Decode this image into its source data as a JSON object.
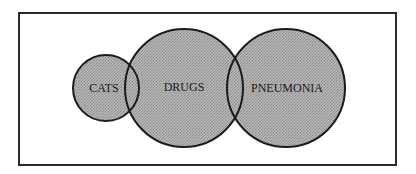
{
  "diagram": {
    "type": "venn",
    "frame": {
      "x": 19,
      "y": 13,
      "width": 377,
      "height": 152,
      "stroke": "#2a2a2a"
    },
    "fill_color": "#a8a8a8",
    "stroke_color": "#1c1c1c",
    "sets": [
      {
        "id": "cats",
        "label": "CATS",
        "cx": 106,
        "cy": 88,
        "r": 33,
        "label_x": 104,
        "label_y": 92
      },
      {
        "id": "drugs",
        "label": "DRUGS",
        "cx": 184,
        "cy": 88,
        "r": 59,
        "label_x": 184,
        "label_y": 91
      },
      {
        "id": "pneumonia",
        "label": "PNEUMONIA",
        "cx": 286,
        "cy": 88,
        "r": 59,
        "label_x": 287,
        "label_y": 92
      }
    ],
    "overlaps": [
      {
        "sets": [
          "cats",
          "drugs"
        ]
      },
      {
        "sets": [
          "drugs",
          "pneumonia"
        ]
      }
    ]
  }
}
